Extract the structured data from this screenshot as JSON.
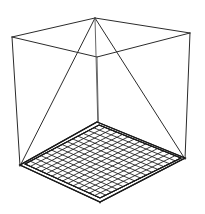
{
  "figure": {
    "background_color": "#ffffff",
    "line_color": "#2b2b2b",
    "grid_line_color": "#1c1c1c",
    "width": 205,
    "height": 214,
    "caption": ""
  },
  "chart_data": {
    "type": "line",
    "xlabel": "",
    "ylabel": "",
    "grid": true,
    "legend": "none",
    "projection": "oblique-perspective",
    "vertices": {
      "top_back": [
        95,
        18
      ],
      "top_left": [
        12,
        37
      ],
      "top_right": [
        190,
        33
      ],
      "top_front": [
        97,
        57
      ],
      "floor_back": [
        97,
        122
      ],
      "floor_left": [
        20,
        165
      ],
      "floor_right": [
        185,
        158
      ],
      "floor_front": [
        100,
        202
      ]
    },
    "edges": [
      [
        "top_back",
        "top_left"
      ],
      [
        "top_left",
        "top_front"
      ],
      [
        "top_front",
        "top_right"
      ],
      [
        "top_right",
        "top_back"
      ],
      [
        "top_left",
        "floor_left"
      ],
      [
        "top_right",
        "floor_right"
      ],
      [
        "top_front",
        "floor_front"
      ],
      [
        "top_back",
        "floor_left"
      ],
      [
        "top_back",
        "floor_right"
      ],
      [
        "top_back",
        "floor_front"
      ]
    ],
    "floor_grid": {
      "shape": "parallelogram",
      "rows": 14,
      "cols": 14,
      "corners": [
        "floor_back",
        "floor_right",
        "floor_front",
        "floor_left"
      ]
    }
  }
}
